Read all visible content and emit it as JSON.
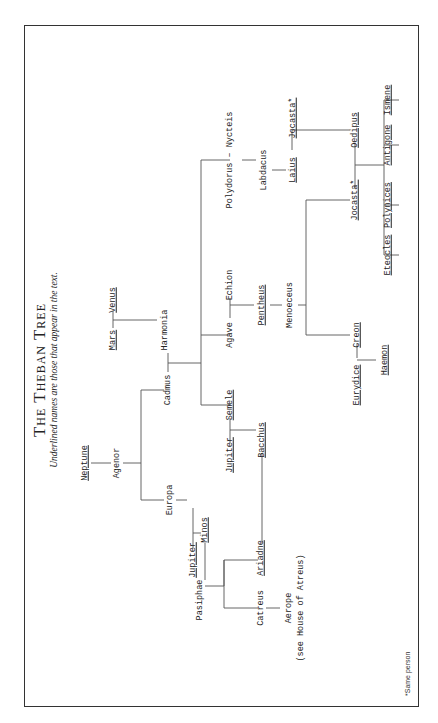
{
  "title": "The Theban Tree",
  "subtitle": "Underlined names are those that appear in the text.",
  "footnote": "*Same person",
  "colors": {
    "line": "#555555",
    "text": "#222222",
    "frame": "#333333"
  },
  "people": {
    "neptune": "Neptune",
    "agenor": "Agenor",
    "mars": "Mars",
    "venus": "Venus",
    "harmonia": "Harmonia",
    "cadmus": "Cadmus",
    "europa": "Europa",
    "jupiter1": "Jupiter",
    "minos": "Minos",
    "pasiphae": "Pasiphae",
    "ariadne": "Ariadne",
    "catreus": "Catreus",
    "aerope": "Aerope",
    "aerope_note": "(see House of Atreus)",
    "semele": "Semele",
    "jupiter2": "Jupiter",
    "bacchus": "Bacchus",
    "agave": "Agave",
    "echion": "Echion",
    "pentheus": "Pentheus",
    "menoeceus": "Menoeceus",
    "creon": "Creon",
    "eurydice": "Eurydice",
    "haemon": "Haemon",
    "polydorus_nycteis": "Polydorus – Nycteis",
    "labdacus": "Labdacus",
    "laius": "Laius",
    "jocasta1": "Jocasta*",
    "oedipus": "Oedipus",
    "jocasta2": "Jocasta*",
    "eteocles": "Eteocles",
    "polynices": "Polynices",
    "antigone": "Antigone",
    "ismene": "Ismene"
  }
}
